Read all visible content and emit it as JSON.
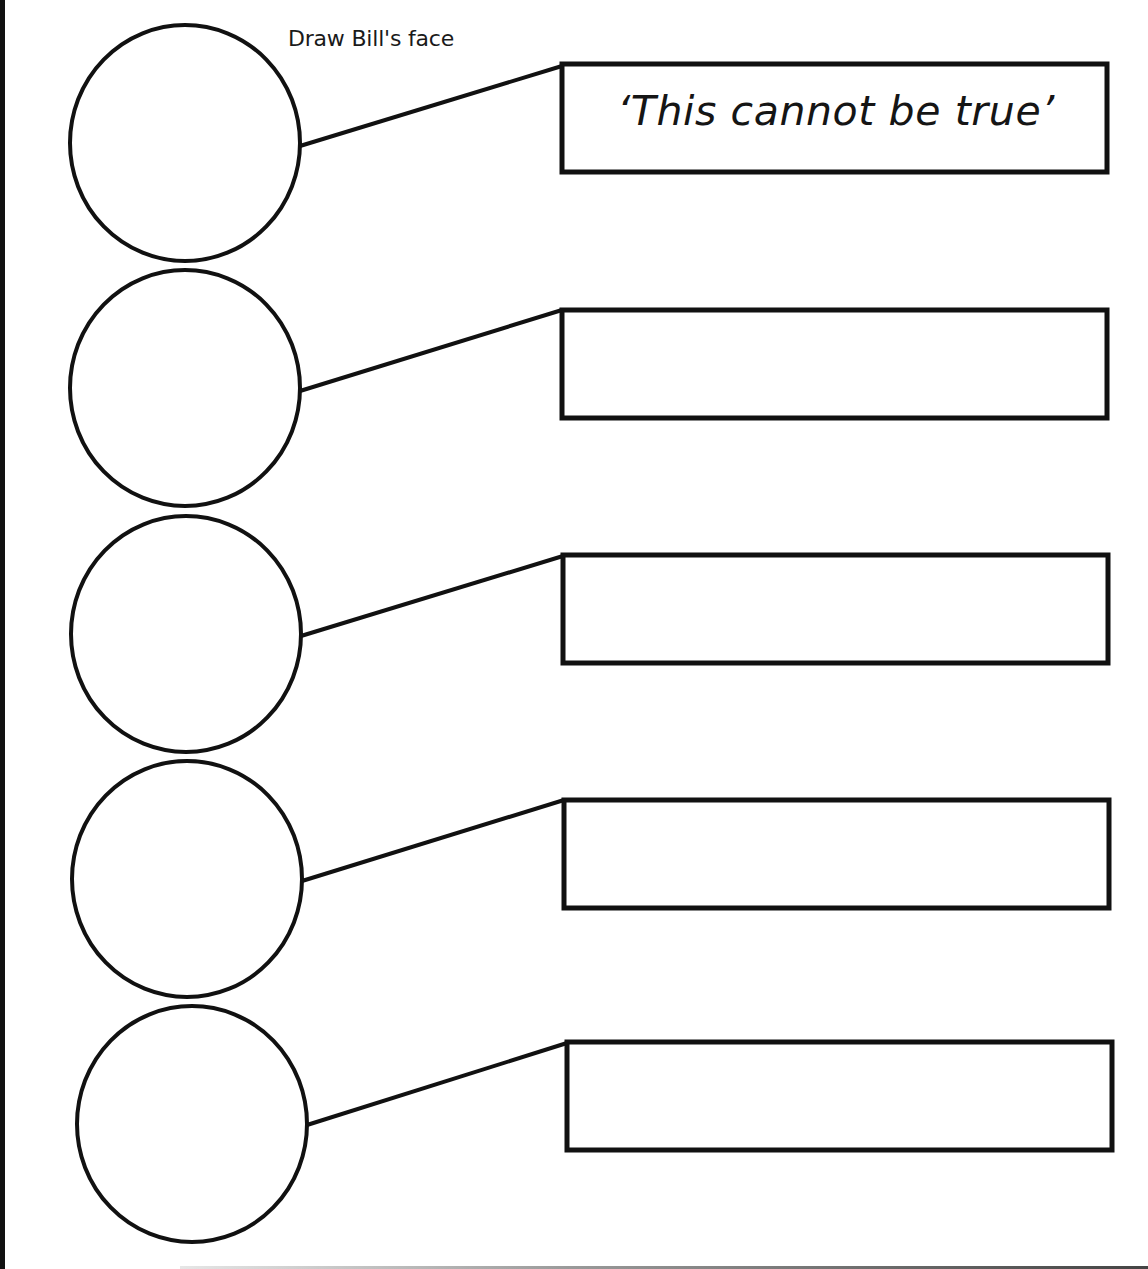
{
  "worksheet": {
    "instruction": "Draw Bill's face",
    "rows": [
      {
        "face_label": "face-circle-1",
        "speech": "‘This cannot be true’"
      },
      {
        "face_label": "face-circle-2",
        "speech": ""
      },
      {
        "face_label": "face-circle-3",
        "speech": ""
      },
      {
        "face_label": "face-circle-4",
        "speech": ""
      },
      {
        "face_label": "face-circle-5",
        "speech": ""
      }
    ]
  },
  "colors": {
    "ink": "#111111",
    "paper": "#ffffff"
  }
}
